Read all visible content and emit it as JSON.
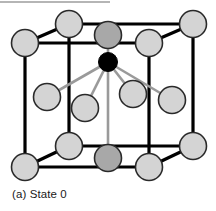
{
  "figure": {
    "caption": "(a) State 0",
    "top_rule": {
      "name": "top-divider-rule",
      "color": "#b5b5b5",
      "width": 110
    },
    "colors": {
      "background": "#ffffff",
      "cube_edge": "#000000",
      "atom_light_fill": "#d4d4d4",
      "atom_light_stroke": "#2a2a2a",
      "atom_dark_fill": "#a8a8a8",
      "atom_dark_stroke": "#2a2a2a",
      "atom_center_fill": "#000000",
      "bond_gray": "#9a9a9a",
      "caption_text": "#1a1a1a"
    },
    "geometry": {
      "cube_edge_width": 3.2,
      "bond_width": 2.6,
      "atom_radius": 13.5,
      "center_atom_radius": 9.5
    },
    "cube_corners": [
      {
        "name": "front-top-left",
        "x": 25,
        "y": 43
      },
      {
        "name": "front-top-right",
        "x": 149,
        "y": 43
      },
      {
        "name": "front-bottom-left",
        "x": 25,
        "y": 167
      },
      {
        "name": "front-bottom-right",
        "x": 149,
        "y": 167
      },
      {
        "name": "back-top-left",
        "x": 69,
        "y": 24
      },
      {
        "name": "back-top-right",
        "x": 193,
        "y": 24
      },
      {
        "name": "back-bottom-left",
        "x": 69,
        "y": 146
      },
      {
        "name": "back-bottom-right",
        "x": 193,
        "y": 146
      }
    ],
    "cube_edges": [
      {
        "name": "front-top-edge",
        "x1": 25,
        "y1": 43,
        "x2": 149,
        "y2": 43
      },
      {
        "name": "front-left-edge",
        "x1": 25,
        "y1": 43,
        "x2": 25,
        "y2": 167
      },
      {
        "name": "front-right-edge",
        "x1": 149,
        "y1": 43,
        "x2": 149,
        "y2": 167
      },
      {
        "name": "front-bottom-edge",
        "x1": 25,
        "y1": 167,
        "x2": 149,
        "y2": 167
      },
      {
        "name": "back-top-edge",
        "x1": 69,
        "y1": 24,
        "x2": 193,
        "y2": 24
      },
      {
        "name": "back-left-edge",
        "x1": 69,
        "y1": 24,
        "x2": 69,
        "y2": 146
      },
      {
        "name": "back-right-edge",
        "x1": 193,
        "y1": 24,
        "x2": 193,
        "y2": 146
      },
      {
        "name": "back-bottom-edge",
        "x1": 69,
        "y1": 146,
        "x2": 193,
        "y2": 146
      },
      {
        "name": "diag-top-left",
        "x1": 25,
        "y1": 43,
        "x2": 69,
        "y2": 24
      },
      {
        "name": "diag-top-right",
        "x1": 149,
        "y1": 43,
        "x2": 193,
        "y2": 24
      },
      {
        "name": "diag-bottom-left",
        "x1": 25,
        "y1": 167,
        "x2": 69,
        "y2": 146
      },
      {
        "name": "diag-bottom-right",
        "x1": 149,
        "y1": 167,
        "x2": 193,
        "y2": 146
      }
    ],
    "atoms": [
      {
        "name": "atom-front-top-left",
        "x": 25,
        "y": 43,
        "shade": "light"
      },
      {
        "name": "atom-front-top-right",
        "x": 149,
        "y": 43,
        "shade": "light"
      },
      {
        "name": "atom-front-bottom-left",
        "x": 25,
        "y": 167,
        "shade": "light"
      },
      {
        "name": "atom-front-bottom-right",
        "x": 149,
        "y": 167,
        "shade": "light"
      },
      {
        "name": "atom-back-top-left",
        "x": 69,
        "y": 24,
        "shade": "light"
      },
      {
        "name": "atom-back-top-right",
        "x": 193,
        "y": 24,
        "shade": "light"
      },
      {
        "name": "atom-back-bottom-left",
        "x": 69,
        "y": 146,
        "shade": "light"
      },
      {
        "name": "atom-back-bottom-right",
        "x": 193,
        "y": 146,
        "shade": "light"
      },
      {
        "name": "atom-top-face-center",
        "x": 108,
        "y": 35,
        "shade": "dark"
      },
      {
        "name": "atom-bottom-face-center",
        "x": 108,
        "y": 158,
        "shade": "dark"
      },
      {
        "name": "atom-left-face-center",
        "x": 47,
        "y": 97,
        "shade": "light"
      },
      {
        "name": "atom-mid-inner-left",
        "x": 85,
        "y": 108,
        "shade": "light"
      },
      {
        "name": "atom-mid-inner-right",
        "x": 133,
        "y": 94,
        "shade": "light"
      },
      {
        "name": "atom-right-face-center",
        "x": 172,
        "y": 100,
        "shade": "light"
      }
    ],
    "center_atom": {
      "name": "atom-body-center",
      "x": 108,
      "y": 62
    },
    "bonds": [
      {
        "name": "bond-center-to-left-face",
        "x1": 108,
        "y1": 62,
        "x2": 47,
        "y2": 97
      },
      {
        "name": "bond-center-to-inner-left",
        "x1": 108,
        "y1": 62,
        "x2": 85,
        "y2": 108
      },
      {
        "name": "bond-center-to-inner-right",
        "x1": 108,
        "y1": 62,
        "x2": 133,
        "y2": 94
      },
      {
        "name": "bond-center-to-right-face",
        "x1": 108,
        "y1": 62,
        "x2": 172,
        "y2": 100
      },
      {
        "name": "bond-center-to-bottom-face",
        "x1": 108,
        "y1": 62,
        "x2": 108,
        "y2": 158
      },
      {
        "name": "bond-center-to-top-face",
        "x1": 108,
        "y1": 62,
        "x2": 108,
        "y2": 35
      }
    ]
  }
}
